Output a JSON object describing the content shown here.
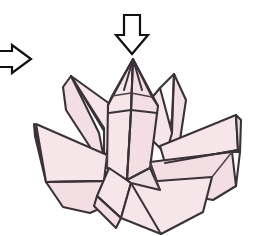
{
  "figure": {
    "title": "Origami folding step diagram",
    "background_color": "#ffffff"
  },
  "colors": {
    "paper_front": "#f6e6e9",
    "paper_front_alt": "#f3dfe3",
    "paper_shade": "#ece0e2",
    "paper_white": "#fdfafb",
    "ink": "#3a3238",
    "arrow_stroke": "#111111",
    "arrow_fill": "#ffffff"
  },
  "arrows": [
    {
      "name": "push-down-arrow",
      "direction": "down",
      "label": "",
      "x": 118,
      "y": 14,
      "width": 28,
      "height": 40
    },
    {
      "name": "process-arrow",
      "direction": "right",
      "label": "",
      "x": -6,
      "y": 44,
      "width": 38,
      "height": 30
    }
  ],
  "model": {
    "name": "lotus-model",
    "petals": [
      {
        "name": "petal-outer-left",
        "side": "left",
        "layer": "outer"
      },
      {
        "name": "petal-outer-right",
        "side": "right",
        "layer": "outer"
      },
      {
        "name": "petal-upper-left",
        "side": "left",
        "layer": "upper"
      },
      {
        "name": "petal-upper-right",
        "side": "right",
        "layer": "upper"
      },
      {
        "name": "petal-center",
        "side": "center",
        "layer": "core"
      },
      {
        "name": "petal-front-left",
        "side": "left",
        "layer": "front"
      },
      {
        "name": "petal-front-right",
        "side": "right",
        "layer": "front"
      },
      {
        "name": "petal-base-bottom",
        "side": "center",
        "layer": "base"
      }
    ],
    "apex": {
      "x": 133,
      "y": 59
    }
  }
}
